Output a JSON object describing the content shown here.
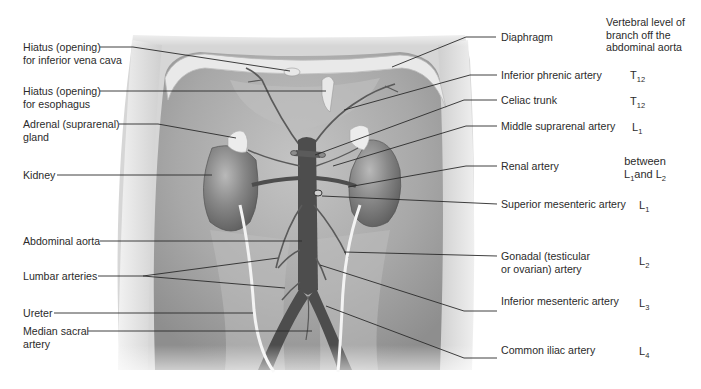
{
  "figure": {
    "level_column_header": "Vertebral level of branch off the abdominal aorta",
    "level_column_header_lines": [
      "Vertebral level of",
      "branch off the",
      "abdominal aorta"
    ]
  },
  "left_labels": [
    {
      "id": "hiatus-ivc",
      "lines": [
        "Hiatus (opening)",
        "for inferior vena cava"
      ]
    },
    {
      "id": "hiatus-esophagus",
      "lines": [
        "Hiatus (opening)",
        "for esophagus"
      ]
    },
    {
      "id": "adrenal-gland",
      "lines": [
        "Adrenal (suprarenal)",
        "gland"
      ]
    },
    {
      "id": "kidney",
      "lines": [
        "Kidney"
      ]
    },
    {
      "id": "abdominal-aorta",
      "lines": [
        "Abdominal aorta"
      ]
    },
    {
      "id": "lumbar-arteries",
      "lines": [
        "Lumbar arteries"
      ]
    },
    {
      "id": "ureter",
      "lines": [
        "Ureter"
      ]
    },
    {
      "id": "median-sacral-artery",
      "lines": [
        "Median sacral",
        "artery"
      ]
    }
  ],
  "right_labels": [
    {
      "id": "diaphragm",
      "lines": [
        "Diaphragm"
      ],
      "level": null
    },
    {
      "id": "inferior-phrenic-artery",
      "lines": [
        "Inferior phrenic artery"
      ],
      "level": {
        "letter": "T",
        "num": "12"
      }
    },
    {
      "id": "celiac-trunk",
      "lines": [
        "Celiac trunk"
      ],
      "level": {
        "letter": "T",
        "num": "12"
      }
    },
    {
      "id": "middle-suprarenal-artery",
      "lines": [
        "Middle suprarenal artery"
      ],
      "level": {
        "letter": "L",
        "num": "1"
      }
    },
    {
      "id": "renal-artery",
      "lines": [
        "Renal artery"
      ],
      "level": {
        "text": "between",
        "a": {
          "letter": "L",
          "num": "1"
        },
        "joiner": "and",
        "b": {
          "letter": "L",
          "num": "2"
        }
      }
    },
    {
      "id": "superior-mesenteric-artery",
      "lines": [
        "Superior mesenteric artery"
      ],
      "level": {
        "letter": "L",
        "num": "1"
      }
    },
    {
      "id": "gonadal-artery",
      "lines": [
        "Gonadal (testicular",
        "or ovarian) artery"
      ],
      "level": {
        "letter": "L",
        "num": "2"
      }
    },
    {
      "id": "inferior-mesenteric-artery",
      "lines": [
        "Inferior mesenteric artery"
      ],
      "level": {
        "letter": "L",
        "num": "3"
      }
    },
    {
      "id": "common-iliac-artery",
      "lines": [
        "Common iliac artery"
      ],
      "level": {
        "letter": "L",
        "num": "4"
      }
    }
  ],
  "colors": {
    "background": "#ffffff",
    "label_text": "#2b2b2b",
    "leader_line": "#2a2a2a",
    "body_wall": "#d9d9d9",
    "cavity": "#a9a9a9",
    "kidney": "#7e7e7e",
    "aorta": "#4a4a4a",
    "ureter": "#f0f0f0",
    "adrenal": "#e6e6e6"
  }
}
